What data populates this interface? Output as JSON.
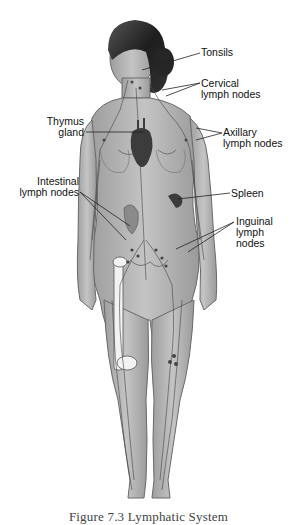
{
  "figure": {
    "caption": "Figure 7.3 Lymphatic System"
  },
  "labels": {
    "tonsils": "Tonsils",
    "cervical_1": "Cervical",
    "cervical_2": "lymph nodes",
    "thymus_1": "Thymus",
    "thymus_2": "gland",
    "axillary_1": "Axillary",
    "axillary_2": "lymph nodes",
    "intestinal_1": "Intestinal",
    "intestinal_2": "lymph nodes",
    "spleen": "Spleen",
    "inguinal_1": "Inguinal",
    "inguinal_2": "lymph",
    "inguinal_3": "nodes"
  },
  "colors": {
    "background": "#ffffff",
    "skin": "#b8b8b8",
    "skin_outline": "#6a6a6a",
    "hair": "#2a2a2a",
    "lymph_vessels": "#4a4a4a",
    "organs": "#3c3c3c",
    "label_text": "#111111",
    "caption_text": "#444444"
  }
}
